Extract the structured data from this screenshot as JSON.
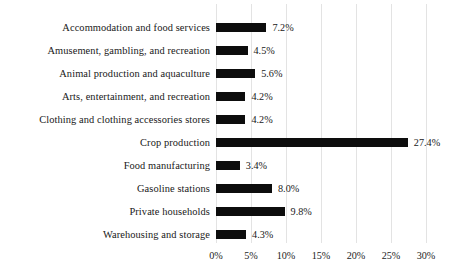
{
  "chart_data": {
    "type": "bar",
    "orientation": "horizontal",
    "title": "",
    "subtitle": "",
    "xlabel": "",
    "ylabel": "",
    "xlim": [
      0,
      30
    ],
    "grid": true,
    "legend": false,
    "value_suffix": "%",
    "xticks": [
      "0%",
      "5%",
      "10%",
      "15%",
      "20%",
      "25%",
      "30%"
    ],
    "xtick_values": [
      0,
      5,
      10,
      15,
      20,
      25,
      30
    ],
    "categories": [
      "Accommodation and food services",
      "Amusement, gambling, and recreation",
      "Animal production and aquaculture",
      "Arts, entertainment, and recreation",
      "Clothing and clothing accessories stores",
      "Crop production",
      "Food manufacturing",
      "Gasoline stations",
      "Private households",
      "Warehousing and storage"
    ],
    "values": [
      7.2,
      4.5,
      5.6,
      4.2,
      4.2,
      27.4,
      3.4,
      8.0,
      9.8,
      4.3
    ],
    "value_labels": [
      "7.2%",
      "4.5%",
      "5.6%",
      "4.2%",
      "4.2%",
      "27.4%",
      "3.4%",
      "8.0%",
      "9.8%",
      "4.3%"
    ],
    "bar_color": "#0d0d0d",
    "grid_color": "#e3e3e3",
    "background_color": "#ffffff"
  }
}
